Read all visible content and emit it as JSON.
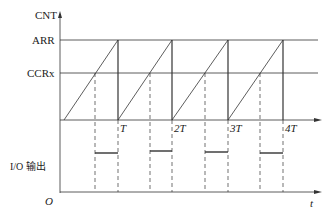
{
  "diagram": {
    "y_axis_label": "CNT",
    "arr_label": "ARR",
    "ccr_label": "CCRx",
    "period_labels": [
      "T",
      "2T",
      "3T",
      "4T"
    ],
    "io_label": "I/O 输出",
    "origin_label": "O",
    "time_label": "t"
  }
}
